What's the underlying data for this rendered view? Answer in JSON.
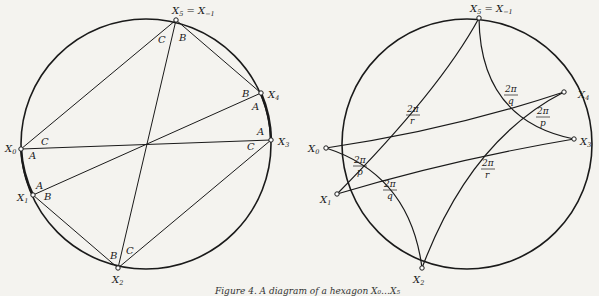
{
  "figure": {
    "caption": "Figure 4. A diagram of a hexagon X₀…X₅",
    "left_diagram": {
      "points": [
        {
          "id": "X0",
          "label": "X",
          "sub": "0"
        },
        {
          "id": "X1",
          "label": "X",
          "sub": "1"
        },
        {
          "id": "X2",
          "label": "X",
          "sub": "2"
        },
        {
          "id": "X3",
          "label": "X",
          "sub": "3"
        },
        {
          "id": "X4",
          "label": "X",
          "sub": "4"
        },
        {
          "id": "X5",
          "label": "X",
          "sub": "5",
          "extra": "= X",
          "extra_sub": "−1"
        }
      ],
      "angle_labels": [
        "C",
        "B",
        "B",
        "A",
        "A",
        "C",
        "C",
        "A",
        "A",
        "B",
        "B",
        "C"
      ]
    },
    "right_diagram": {
      "points": [
        {
          "id": "X0",
          "label": "X",
          "sub": "0"
        },
        {
          "id": "X1",
          "label": "X",
          "sub": "1"
        },
        {
          "id": "X2",
          "label": "X",
          "sub": "2"
        },
        {
          "id": "X3",
          "label": "X",
          "sub": "3"
        },
        {
          "id": "X4",
          "label": "X",
          "sub": "4"
        },
        {
          "id": "X5",
          "label": "X",
          "sub": "5",
          "extra": "= X",
          "extra_sub": "−1"
        }
      ],
      "angle_fractions": [
        {
          "num": "2π",
          "den": "r"
        },
        {
          "num": "2π",
          "den": "q"
        },
        {
          "num": "2π",
          "den": "p"
        },
        {
          "num": "2π",
          "den": "p"
        },
        {
          "num": "2π",
          "den": "q"
        },
        {
          "num": "2π",
          "den": "r"
        }
      ]
    }
  }
}
